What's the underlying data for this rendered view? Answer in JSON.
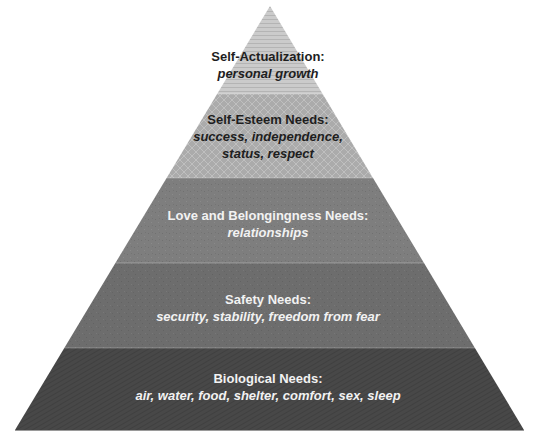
{
  "diagram": {
    "type": "pyramid",
    "apex": {
      "x": 270,
      "y": 6
    },
    "base": {
      "left_x": 15,
      "right_x": 524,
      "y": 430
    },
    "levels": [
      {
        "title": "Self-Actualization:",
        "description_lines": [
          "personal growth"
        ],
        "top_y": 6,
        "bottom_y": 94,
        "fill": "#c9c9c9",
        "pattern": "horizontal-lines",
        "text_color": "dark",
        "label_top": 48
      },
      {
        "title": "Self-Esteem Needs:",
        "description_lines": [
          "success, independence,",
          "status, respect"
        ],
        "top_y": 94,
        "bottom_y": 178,
        "fill": "#a9a9a9",
        "pattern": "diamond-lattice",
        "text_color": "dark",
        "label_top": 111
      },
      {
        "title": "Love and Belongingness Needs:",
        "description_lines": [
          "relationships"
        ],
        "top_y": 178,
        "bottom_y": 263,
        "fill": "#7d7d7d",
        "pattern": "speckle",
        "text_color": "light",
        "label_top": 207
      },
      {
        "title": "Safety Needs:",
        "description_lines": [
          "security, stability, freedom from fear"
        ],
        "top_y": 263,
        "bottom_y": 348,
        "fill": "#6e6e6e",
        "pattern": "speckle",
        "text_color": "light",
        "label_top": 291
      },
      {
        "title": "Biological Needs:",
        "description_lines": [
          "air, water, food, shelter, comfort, sex, sleep"
        ],
        "top_y": 348,
        "bottom_y": 430,
        "fill": "#4a4a4a",
        "pattern": "diagonal-hatch",
        "text_color": "light",
        "label_top": 370
      }
    ]
  },
  "labels": {
    "l0": {
      "title": "Self-Actualization:",
      "d0": "personal growth"
    },
    "l1": {
      "title": "Self-Esteem Needs:",
      "d0": "success, independence,",
      "d1": "status, respect"
    },
    "l2": {
      "title": "Love and Belongingness Needs:",
      "d0": "relationships"
    },
    "l3": {
      "title": "Safety Needs:",
      "d0": "security, stability, freedom from fear"
    },
    "l4": {
      "title": "Biological Needs:",
      "d0": "air, water, food, shelter, comfort, sex, sleep"
    }
  }
}
